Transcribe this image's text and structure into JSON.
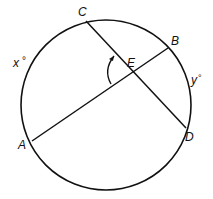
{
  "diagram": {
    "type": "circle-intersecting-chords",
    "circle": {
      "cx": 106,
      "cy": 105,
      "r": 85
    },
    "points": [
      {
        "id": "C",
        "label": "C",
        "x": 86,
        "y": 21,
        "lx": 76,
        "ly": 16
      },
      {
        "id": "B",
        "label": "B",
        "x": 168,
        "y": 48,
        "lx": 171,
        "ly": 44
      },
      {
        "id": "D",
        "label": "D",
        "x": 186,
        "y": 128,
        "lx": 185,
        "ly": 141
      },
      {
        "id": "A",
        "label": "A",
        "x": 32,
        "y": 141,
        "lx": 17,
        "ly": 148
      },
      {
        "id": "E",
        "label": "E",
        "x": 132,
        "y": 73,
        "lx": 127,
        "ly": 66
      }
    ],
    "chords": [
      {
        "from": "C",
        "to": "D"
      },
      {
        "from": "A",
        "to": "B"
      }
    ],
    "arc_labels": [
      {
        "id": "x",
        "label": "x",
        "degree": "°",
        "x": 13,
        "y": 67
      },
      {
        "id": "y",
        "label": "y",
        "degree": "°",
        "x": 192,
        "y": 84
      }
    ],
    "angle_mark": {
      "vertex": "E",
      "description": "arc arrow marking angle CEA"
    },
    "stroke_color": "#111111"
  }
}
